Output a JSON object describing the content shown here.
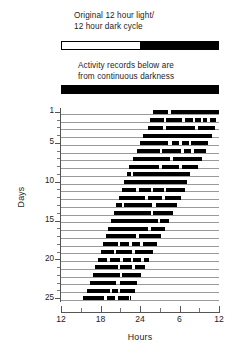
{
  "captions": {
    "light_dark": "Original 12 hour light/\n12 hour dark cycle",
    "darkness": "Activity records below are\nfrom continuous darkness"
  },
  "reference_bars": {
    "light_dark_cycle": {
      "name": "original-12h-light-12h-dark",
      "segments": [
        {
          "phase": "light",
          "start_hour": 12,
          "end_hour": 24,
          "color": "#ffffff"
        },
        {
          "phase": "dark",
          "start_hour": 24,
          "end_hour": 36,
          "color": "#000000"
        }
      ]
    },
    "constant_darkness": {
      "name": "constant-darkness",
      "segments": [
        {
          "phase": "dark",
          "start_hour": 12,
          "end_hour": 36,
          "color": "#000000"
        }
      ]
    }
  },
  "chart_data": {
    "type": "actogram",
    "title": "",
    "xlabel": "Hours",
    "ylabel": "Days",
    "xlim": [
      12,
      36
    ],
    "ylim": [
      1,
      25
    ],
    "grid": false,
    "legend": null,
    "x_major_ticks": [
      12,
      18,
      24,
      30,
      36
    ],
    "x_major_tick_labels": [
      "12",
      "18",
      "24",
      "6",
      "12"
    ],
    "x_minor_ticks": [
      15,
      21,
      27,
      33
    ],
    "y_major_ticks": [
      1,
      5,
      10,
      15,
      20,
      25
    ],
    "y_major_tick_labels": [
      "1",
      "5",
      "10",
      "15",
      "20",
      "25"
    ],
    "activity_color": "#000000",
    "baseline_color": "#9a9a9a",
    "days": [
      {
        "day": 1,
        "onset_hour": 26.0,
        "offset_hour": 36.0,
        "bouts": [
          [
            26.0,
            28.2
          ],
          [
            28.7,
            36.0
          ]
        ]
      },
      {
        "day": 2,
        "onset_hour": 25.5,
        "offset_hour": 35.6,
        "bouts": [
          [
            25.5,
            27.6
          ],
          [
            28.0,
            30.4
          ],
          [
            30.8,
            32.0
          ],
          [
            32.4,
            33.2
          ],
          [
            33.6,
            34.2
          ],
          [
            34.6,
            35.6
          ]
        ]
      },
      {
        "day": 3,
        "onset_hour": 25.2,
        "offset_hour": 35.4,
        "bouts": [
          [
            25.2,
            27.5
          ],
          [
            28.0,
            32.3
          ],
          [
            32.8,
            35.4
          ]
        ]
      },
      {
        "day": 4,
        "onset_hour": 24.4,
        "offset_hour": 35.0,
        "bouts": [
          [
            24.4,
            35.0
          ]
        ]
      },
      {
        "day": 5,
        "onset_hour": 24.0,
        "offset_hour": 34.4,
        "bouts": [
          [
            24.0,
            28.3
          ],
          [
            28.8,
            30.0
          ],
          [
            30.4,
            31.4
          ],
          [
            31.8,
            34.4
          ]
        ]
      },
      {
        "day": 6,
        "onset_hour": 23.6,
        "offset_hour": 34.0,
        "bouts": [
          [
            23.6,
            27.0
          ],
          [
            27.4,
            30.3
          ],
          [
            30.7,
            31.8
          ],
          [
            32.2,
            34.0
          ]
        ]
      },
      {
        "day": 7,
        "onset_hour": 23.0,
        "offset_hour": 33.4,
        "bouts": [
          [
            23.0,
            28.6
          ],
          [
            29.0,
            33.4
          ]
        ]
      },
      {
        "day": 8,
        "onset_hour": 22.4,
        "offset_hour": 32.8,
        "bouts": [
          [
            22.4,
            26.9
          ],
          [
            27.3,
            30.0
          ],
          [
            30.4,
            32.8
          ]
        ]
      },
      {
        "day": 9,
        "onset_hour": 22.0,
        "offset_hour": 31.6,
        "bouts": [
          [
            22.0,
            22.6
          ],
          [
            23.0,
            31.6
          ]
        ]
      },
      {
        "day": 10,
        "onset_hour": 21.6,
        "offset_hour": 31.2,
        "bouts": [
          [
            21.6,
            31.2
          ]
        ]
      },
      {
        "day": 11,
        "onset_hour": 21.2,
        "offset_hour": 30.8,
        "bouts": [
          [
            21.2,
            23.4
          ],
          [
            23.8,
            25.6
          ],
          [
            26.0,
            27.6
          ],
          [
            28.0,
            30.8
          ]
        ]
      },
      {
        "day": 12,
        "onset_hour": 20.8,
        "offset_hour": 30.2,
        "bouts": [
          [
            20.8,
            24.8
          ],
          [
            25.2,
            27.3
          ],
          [
            27.8,
            30.2
          ]
        ]
      },
      {
        "day": 13,
        "onset_hour": 20.4,
        "offset_hour": 29.6,
        "bouts": [
          [
            20.4,
            21.2
          ],
          [
            21.6,
            25.9
          ],
          [
            26.4,
            29.6
          ]
        ]
      },
      {
        "day": 14,
        "onset_hour": 20.0,
        "offset_hour": 29.0,
        "bouts": [
          [
            20.0,
            25.6
          ],
          [
            26.0,
            29.0
          ]
        ]
      },
      {
        "day": 15,
        "onset_hour": 19.6,
        "offset_hour": 28.4,
        "bouts": [
          [
            19.6,
            26.7
          ],
          [
            27.1,
            28.4
          ]
        ]
      },
      {
        "day": 16,
        "onset_hour": 19.2,
        "offset_hour": 27.8,
        "bouts": [
          [
            19.2,
            25.2
          ],
          [
            25.7,
            27.8
          ]
        ]
      },
      {
        "day": 17,
        "onset_hour": 18.8,
        "offset_hour": 27.2,
        "bouts": [
          [
            18.8,
            23.4
          ],
          [
            23.8,
            27.2
          ]
        ]
      },
      {
        "day": 18,
        "onset_hour": 18.4,
        "offset_hour": 26.6,
        "bouts": [
          [
            18.4,
            20.6
          ],
          [
            21.0,
            22.4
          ],
          [
            22.8,
            24.0
          ],
          [
            24.4,
            26.6
          ]
        ]
      },
      {
        "day": 19,
        "onset_hour": 18.0,
        "offset_hour": 26.0,
        "bouts": [
          [
            18.0,
            20.0
          ],
          [
            20.4,
            22.8
          ],
          [
            23.2,
            26.0
          ]
        ]
      },
      {
        "day": 20,
        "onset_hour": 17.6,
        "offset_hour": 25.4,
        "bouts": [
          [
            17.6,
            19.0
          ],
          [
            19.4,
            21.0
          ],
          [
            21.4,
            22.6
          ],
          [
            23.0,
            24.2
          ],
          [
            24.6,
            25.4
          ]
        ]
      },
      {
        "day": 21,
        "onset_hour": 17.2,
        "offset_hour": 24.8,
        "bouts": [
          [
            17.2,
            20.6
          ],
          [
            21.0,
            22.8
          ],
          [
            23.2,
            24.8
          ]
        ]
      },
      {
        "day": 22,
        "onset_hour": 16.8,
        "offset_hour": 24.2,
        "bouts": [
          [
            16.8,
            20.9
          ],
          [
            21.3,
            24.2
          ]
        ]
      },
      {
        "day": 23,
        "onset_hour": 16.4,
        "offset_hour": 23.6,
        "bouts": [
          [
            16.4,
            20.4
          ],
          [
            20.9,
            23.6
          ]
        ]
      },
      {
        "day": 24,
        "onset_hour": 16.0,
        "offset_hour": 23.2,
        "bouts": [
          [
            16.0,
            19.4
          ],
          [
            19.8,
            20.6
          ],
          [
            21.0,
            23.2
          ]
        ]
      },
      {
        "day": 25,
        "onset_hour": 15.4,
        "offset_hour": 22.6,
        "bouts": [
          [
            15.4,
            18.6
          ],
          [
            19.0,
            20.2
          ],
          [
            20.6,
            22.4
          ],
          [
            22.5,
            22.6
          ]
        ]
      }
    ]
  }
}
